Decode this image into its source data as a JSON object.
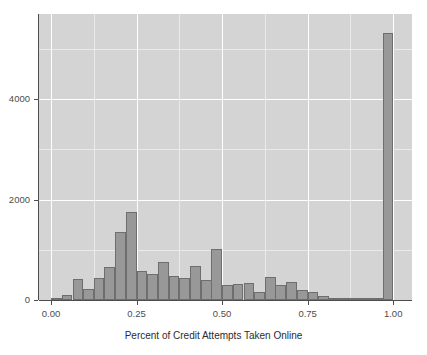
{
  "chart_data": {
    "type": "bar",
    "title": "",
    "subtitle": "",
    "xlabel": "Percent of Credit Attempts Taken Online",
    "ylabel": "",
    "xlim": [
      -0.035,
      1.055
    ],
    "ylim": [
      0,
      5700
    ],
    "grid": true,
    "legend": null,
    "bin_width": 0.03125,
    "xticks": [
      "0.00",
      "0.25",
      "0.50",
      "0.75",
      "1.00"
    ],
    "xtick_values": [
      0.0,
      0.25,
      0.5,
      0.75,
      1.0
    ],
    "yticks": [
      "0",
      "2000",
      "4000"
    ],
    "ytick_values": [
      0,
      2000,
      4000
    ],
    "bar_color": "#989898",
    "bar_border_color": "#6e6e6e",
    "panel_color": "#d4d4d4",
    "gridline_color": "#ffffff",
    "axis_color": "#4d4d4d",
    "bins": [
      {
        "x": 0.0,
        "value": 20
      },
      {
        "x": 0.031,
        "value": 90
      },
      {
        "x": 0.063,
        "value": 420
      },
      {
        "x": 0.094,
        "value": 210
      },
      {
        "x": 0.125,
        "value": 440
      },
      {
        "x": 0.156,
        "value": 650
      },
      {
        "x": 0.188,
        "value": 1350
      },
      {
        "x": 0.219,
        "value": 1760
      },
      {
        "x": 0.25,
        "value": 580
      },
      {
        "x": 0.281,
        "value": 520
      },
      {
        "x": 0.313,
        "value": 760
      },
      {
        "x": 0.344,
        "value": 480
      },
      {
        "x": 0.375,
        "value": 440
      },
      {
        "x": 0.406,
        "value": 680
      },
      {
        "x": 0.438,
        "value": 400
      },
      {
        "x": 0.469,
        "value": 1020
      },
      {
        "x": 0.5,
        "value": 290
      },
      {
        "x": 0.531,
        "value": 320
      },
      {
        "x": 0.563,
        "value": 330
      },
      {
        "x": 0.594,
        "value": 160
      },
      {
        "x": 0.625,
        "value": 450
      },
      {
        "x": 0.656,
        "value": 290
      },
      {
        "x": 0.688,
        "value": 350
      },
      {
        "x": 0.719,
        "value": 190
      },
      {
        "x": 0.75,
        "value": 160
      },
      {
        "x": 0.781,
        "value": 80
      },
      {
        "x": 0.813,
        "value": 50
      },
      {
        "x": 0.844,
        "value": 40
      },
      {
        "x": 0.875,
        "value": 30
      },
      {
        "x": 0.906,
        "value": 25
      },
      {
        "x": 0.938,
        "value": 20
      },
      {
        "x": 0.969,
        "value": 5320
      }
    ]
  }
}
